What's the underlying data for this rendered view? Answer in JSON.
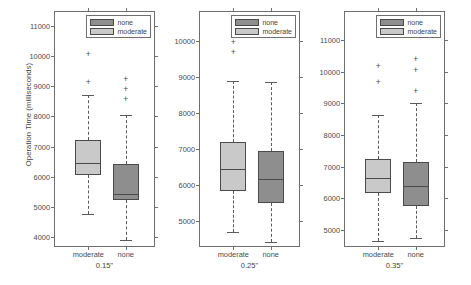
{
  "chart_data": {
    "type": "box",
    "title": "",
    "ylabel": "Operation Time (milliseconds)",
    "xlabel": "",
    "grid": false,
    "legend": {
      "position": "top-right-inside-each-panel",
      "entries": [
        {
          "label": "none",
          "color": "#8e8e8e"
        },
        {
          "label": "moderate",
          "color": "#c9c9c9"
        }
      ]
    },
    "panels": [
      {
        "name": "panel-015",
        "xlabel": "0.15\"",
        "ytick_labels": [
          "4000",
          "5000",
          "6000",
          "7000",
          "8000",
          "9000",
          "10000",
          "11000"
        ],
        "ytick_values": [
          4000,
          5000,
          6000,
          7000,
          8000,
          9000,
          10000,
          11000
        ],
        "ylim": [
          3650,
          11450
        ],
        "categories": [
          "moderate",
          "none"
        ],
        "boxes": [
          {
            "category": "moderate",
            "fill": "#c9c9c9",
            "q1": 6050,
            "median": 6450,
            "q3": 7230,
            "whisker_low": 4760,
            "whisker_high": 8710,
            "outliers": [
              9150,
              10050,
              11010
            ]
          },
          {
            "category": "none",
            "fill": "#8e8e8e",
            "q1": 5230,
            "median": 5450,
            "q3": 6430,
            "whisker_low": 3900,
            "whisker_high": 8030,
            "outliers": [
              8570,
              8900,
              9250
            ]
          }
        ]
      },
      {
        "name": "panel-025",
        "xlabel": "0.25\"",
        "ytick_labels": [
          "5000",
          "6000",
          "7000",
          "8000",
          "9000",
          "10000"
        ],
        "ytick_values": [
          5000,
          6000,
          7000,
          8000,
          9000,
          10000
        ],
        "ylim": [
          4250,
          10800
        ],
        "categories": [
          "moderate",
          "none"
        ],
        "boxes": [
          {
            "category": "moderate",
            "fill": "#c9c9c9",
            "q1": 5830,
            "median": 6440,
            "q3": 7180,
            "whisker_low": 4700,
            "whisker_high": 8880,
            "outliers": [
              9680,
              9980,
              10560
            ]
          },
          {
            "category": "none",
            "fill": "#8e8e8e",
            "q1": 5490,
            "median": 6160,
            "q3": 6930,
            "whisker_low": 4420,
            "whisker_high": 8860,
            "outliers": []
          }
        ]
      },
      {
        "name": "panel-035",
        "xlabel": "0.35\"",
        "ytick_labels": [
          "5000",
          "6000",
          "7000",
          "8000",
          "9000",
          "10000",
          "11000"
        ],
        "ytick_values": [
          5000,
          6000,
          7000,
          8000,
          9000,
          10000,
          11000
        ],
        "ylim": [
          4420,
          11900
        ],
        "categories": [
          "moderate",
          "none"
        ],
        "boxes": [
          {
            "category": "moderate",
            "fill": "#c9c9c9",
            "q1": 6150,
            "median": 6650,
            "q3": 7230,
            "whisker_low": 4650,
            "whisker_high": 8650,
            "outliers": [
              9670,
              10200,
              11620
            ]
          },
          {
            "category": "none",
            "fill": "#8e8e8e",
            "q1": 5760,
            "median": 6400,
            "q3": 7130,
            "whisker_low": 4750,
            "whisker_high": 9000,
            "outliers": [
              9400,
              10050,
              10400
            ]
          }
        ]
      }
    ]
  }
}
